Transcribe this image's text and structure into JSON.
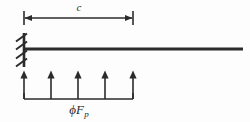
{
  "figure": {
    "type": "cantilever-beam-free-body-diagram",
    "background_color": "#fdfdfd",
    "line_color": "#2b2b2b",
    "dimension": {
      "label": "c",
      "label_name": "span-length-c",
      "start_x": 24,
      "end_x": 133,
      "y": 18
    },
    "support": {
      "kind": "fixed-support",
      "x": 24,
      "top_y": 33,
      "bottom_y": 67,
      "hatch_count": 4
    },
    "beam": {
      "start_x": 24,
      "end_x": 243,
      "y": 49,
      "thickness": 3
    },
    "load": {
      "label_phi": "ϕ",
      "label_main": "F",
      "label_sub": "p",
      "label_full": "ϕF_p",
      "direction": "up",
      "arrow_count": 5,
      "arrow_x_positions": [
        24,
        51,
        78,
        105,
        133
      ],
      "arrow_tip_y": 71,
      "arrow_base_y": 99,
      "baseline_start_x": 24,
      "baseline_end_x": 133,
      "baseline_y": 99
    }
  }
}
